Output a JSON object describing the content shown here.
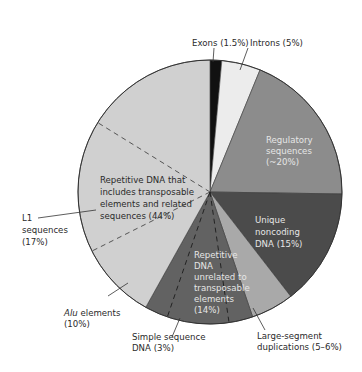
{
  "chart_data": {
    "type": "pie",
    "title": "",
    "start_angle_deg": 0,
    "direction": "clockwise",
    "slices": [
      {
        "key": "exons",
        "label": "Exons (1.5%)",
        "value": 1.5,
        "color": "#111111"
      },
      {
        "key": "introns",
        "label": "Introns (5%)",
        "value": 5,
        "color": "#ececec"
      },
      {
        "key": "regulatory",
        "label": "Regulatory sequences (~20%)",
        "value": 20,
        "color": "#8c8c8c"
      },
      {
        "key": "unique_noncoding",
        "label": "Unique noncoding DNA (15%)",
        "value": 15,
        "color": "#4b4b4b"
      },
      {
        "key": "large_segment_dup",
        "label": "Large-segment duplications (5–6%)",
        "value": 5.5,
        "color": "#a9a9a9"
      },
      {
        "key": "repetitive_unrelated",
        "label": "Repetitive DNA unrelated to transposable elements (14%)",
        "value": 14,
        "color": "#626262"
      },
      {
        "key": "repetitive_te",
        "label": "Repetitive DNA that includes transposable elements and related sequences (44%)",
        "value": 44,
        "color": "#d0d0d0"
      }
    ],
    "sub_slices": [
      {
        "parent": "repetitive_te",
        "label": "L1 sequences (17%)",
        "value": 17
      },
      {
        "parent": "repetitive_te",
        "label": "Alu elements (10%)",
        "value": 10
      },
      {
        "parent": "repetitive_unrelated",
        "label": "Simple sequence DNA (3%)",
        "value": 3
      }
    ],
    "legend": "none (direct labels)"
  },
  "labels": {
    "exons": "Exons (1.5%)",
    "introns": "Introns (5%)",
    "regulatory": [
      "Regulatory",
      "sequences",
      "(~20%)"
    ],
    "unique": [
      "Unique",
      "noncoding",
      "DNA (15%)"
    ],
    "repetitive_unrelated": [
      "Repetitive",
      "DNA",
      "unrelated to",
      "transposable",
      "elements",
      "(14%)"
    ],
    "large_segment": [
      "Large-segment",
      "duplications (5–6%)"
    ],
    "simple_sequence": [
      "Simple sequence",
      "DNA (3%)"
    ],
    "alu": [
      "Alu",
      " elements",
      "(10%)"
    ],
    "l1": [
      "L1",
      "sequences",
      "(17%)"
    ],
    "repetitive_te": [
      "Repetitive DNA that",
      "includes transposable",
      "elements and related",
      "sequences (44%)"
    ]
  }
}
